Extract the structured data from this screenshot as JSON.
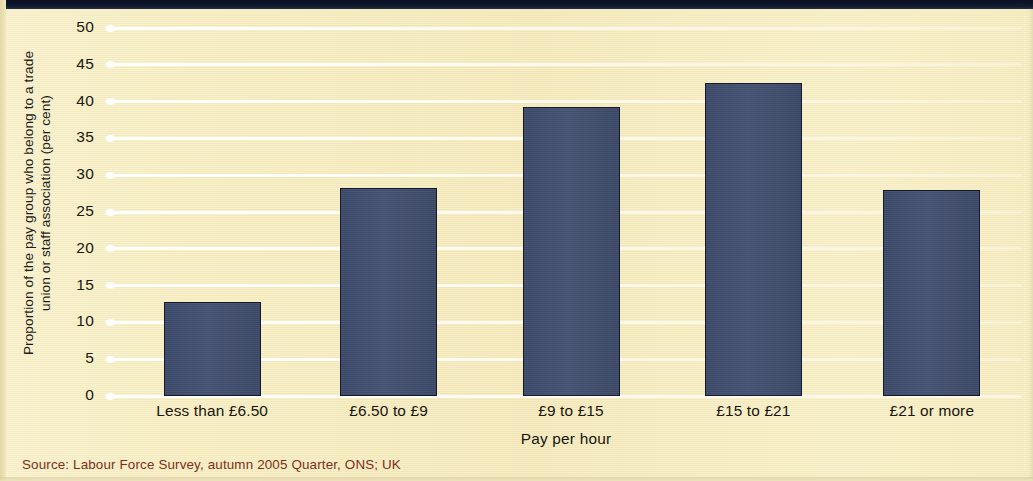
{
  "figure": {
    "background_color": "#f6edc2",
    "bar_color": "#414e70",
    "gridline_color": "#ffffff",
    "source_color": "#7d2f1c",
    "top_border_color": "#0d1324"
  },
  "source": {
    "text": "Source: Labour Force Survey, autumn 2005 Quarter, ONS; UK"
  },
  "chart_data": {
    "type": "bar",
    "title": "",
    "subtitle": "",
    "xlabel": "Pay per hour",
    "ylabel_lines": [
      "Proportion of the pay group who belong to a trade",
      "union or staff association (per cent)"
    ],
    "ylabel": "Proportion of the pay group who belong to a trade union or staff association (per cent)",
    "categories": [
      "Less than £6.50",
      "£6.50 to £9",
      "£9 to £15",
      "£15 to £21",
      "£21 or more"
    ],
    "values": [
      12.8,
      28.3,
      39.3,
      42.5,
      28.0
    ],
    "ylim": [
      0,
      50
    ],
    "ytick_values": [
      0,
      5,
      10,
      15,
      20,
      25,
      30,
      35,
      40,
      45,
      50
    ],
    "ytick_labels": [
      "0",
      "5",
      "10",
      "15",
      "20",
      "25",
      "30",
      "35",
      "40",
      "45",
      "50"
    ],
    "grid": true,
    "grid_axis": "y",
    "legend": false,
    "legend_position": "none",
    "series": [
      {
        "name": "Trade union or staff association membership",
        "values": [
          12.8,
          28.3,
          39.3,
          42.5,
          28.0
        ]
      }
    ]
  }
}
